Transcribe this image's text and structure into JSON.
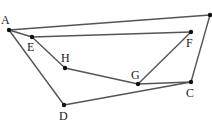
{
  "diagram": {
    "type": "geometry-figure",
    "points": [
      {
        "id": "A",
        "label": "A",
        "x": 9,
        "y": 30,
        "lx": 1,
        "ly": 24
      },
      {
        "id": "B",
        "label": "",
        "x": 210,
        "y": 15,
        "lx": 205,
        "ly": 10
      },
      {
        "id": "C",
        "label": "C",
        "x": 191,
        "y": 82,
        "lx": 186,
        "ly": 97
      },
      {
        "id": "D",
        "label": "D",
        "x": 64,
        "y": 105,
        "lx": 59,
        "ly": 120
      },
      {
        "id": "E",
        "label": "E",
        "x": 32,
        "y": 37,
        "lx": 27,
        "ly": 51
      },
      {
        "id": "F",
        "label": "F",
        "x": 191,
        "y": 32,
        "lx": 186,
        "ly": 47
      },
      {
        "id": "G",
        "label": "G",
        "x": 138,
        "y": 84,
        "lx": 131,
        "ly": 79
      },
      {
        "id": "H",
        "label": "H",
        "x": 65,
        "y": 68,
        "lx": 61,
        "ly": 62
      }
    ],
    "segments": [
      [
        "A",
        "B"
      ],
      [
        "A",
        "D"
      ],
      [
        "D",
        "C"
      ],
      [
        "C",
        "B"
      ],
      [
        "A",
        "E"
      ],
      [
        "E",
        "F"
      ],
      [
        "E",
        "H"
      ],
      [
        "H",
        "G"
      ],
      [
        "G",
        "F"
      ],
      [
        "G",
        "C"
      ]
    ],
    "colors": {
      "line": "#555555",
      "point": "#111111",
      "label": "#222222"
    }
  }
}
